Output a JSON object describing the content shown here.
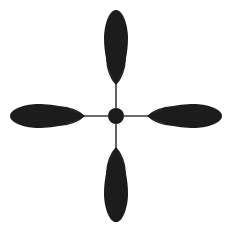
{
  "figure": {
    "width": 231,
    "height": 229,
    "background_color": "#ffffff"
  },
  "colors": {
    "lobe_filled": "#1c1c1c",
    "lobe_hollow_fill": "#ffffff",
    "lobe_outline": "#1c1c1c",
    "connector_line": "#3a3a3a",
    "nucleus": "#1c1c1c"
  },
  "geometry": {
    "center": {
      "x": 116,
      "y": 116
    },
    "nucleus_radius": 8,
    "connector_width": 1.6,
    "outline_width": 1.5,
    "arm_rotations": [
      0,
      90,
      180,
      270
    ],
    "filled_lobe": {
      "tip_distance": 32,
      "outer_distance": 106,
      "half_width": 12
    },
    "hollow_lobe": {
      "tip_distance": 32,
      "inner_distance": 68,
      "half_width": 9
    },
    "connector": {
      "start_distance": 8,
      "end_distance": 44
    }
  },
  "elements": {
    "nucleus_label": "nucleus",
    "arms": [
      {
        "id": "arm-up",
        "direction": "up",
        "rotation": 0
      },
      {
        "id": "arm-right",
        "direction": "right",
        "rotation": 90
      },
      {
        "id": "arm-down",
        "direction": "down",
        "rotation": 180
      },
      {
        "id": "arm-left",
        "direction": "left",
        "rotation": 270
      }
    ]
  }
}
